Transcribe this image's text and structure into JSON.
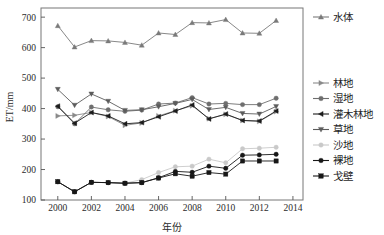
{
  "chart_data": {
    "type": "line",
    "title": "",
    "xlabel": "年份",
    "ylabel": "ET/mm",
    "x": [
      2000,
      2001,
      2002,
      2003,
      2004,
      2005,
      2006,
      2007,
      2008,
      2009,
      2010,
      2011,
      2012,
      2013
    ],
    "xlim": [
      1999,
      2014.6
    ],
    "ylim": [
      100,
      730
    ],
    "xticks": [
      2000,
      2002,
      2004,
      2006,
      2008,
      2010,
      2012,
      2014
    ],
    "yticks": [
      100,
      200,
      300,
      400,
      500,
      600,
      700
    ],
    "grid": false,
    "legend_position": "right",
    "series": [
      {
        "name": "水体",
        "color": "#7a7a7a",
        "marker": "triangle-up",
        "values": [
          672,
          602,
          623,
          622,
          617,
          608,
          648,
          643,
          682,
          681,
          692,
          648,
          647,
          689
        ]
      },
      {
        "name": "林地",
        "color": "#8a8a8a",
        "marker": "triangle-right",
        "values": [
          376,
          378,
          387,
          374,
          345,
          353,
          376,
          393,
          409,
          367,
          381,
          361,
          358,
          390
        ]
      },
      {
        "name": "湿地",
        "color": "#6e6e6e",
        "marker": "circle",
        "values": [
          406,
          350,
          405,
          396,
          391,
          395,
          415,
          418,
          436,
          415,
          417,
          413,
          413,
          434
        ]
      },
      {
        "name": "灌木林地",
        "color": "#1c1c1c",
        "marker": "triangle-left",
        "values": [
          408,
          352,
          387,
          376,
          350,
          354,
          373,
          392,
          412,
          366,
          382,
          361,
          359,
          392
        ]
      },
      {
        "name": "草地",
        "color": "#5c5c5c",
        "marker": "triangle-down",
        "values": [
          463,
          411,
          448,
          424,
          394,
          396,
          406,
          417,
          430,
          397,
          404,
          384,
          382,
          407
        ]
      },
      {
        "name": "沙地",
        "color": "#c9c9c9",
        "marker": "circle",
        "values": [
          160,
          127,
          158,
          157,
          155,
          167,
          190,
          209,
          211,
          234,
          222,
          268,
          270,
          273
        ]
      },
      {
        "name": "裸地",
        "color": "#171717",
        "marker": "circle",
        "values": [
          160,
          127,
          158,
          157,
          155,
          157,
          173,
          194,
          191,
          211,
          204,
          247,
          248,
          250
        ]
      },
      {
        "name": "戈壁",
        "color": "#171717",
        "marker": "square",
        "values": [
          160,
          127,
          158,
          157,
          155,
          157,
          172,
          186,
          178,
          190,
          185,
          228,
          228,
          228
        ]
      }
    ],
    "legend_groups": [
      {
        "items": [
          "水体"
        ]
      },
      {
        "items": [
          "林地",
          "湿地",
          "灌木林地",
          "草地"
        ]
      },
      {
        "items": [
          "沙地",
          "裸地",
          "戈壁"
        ]
      }
    ]
  }
}
